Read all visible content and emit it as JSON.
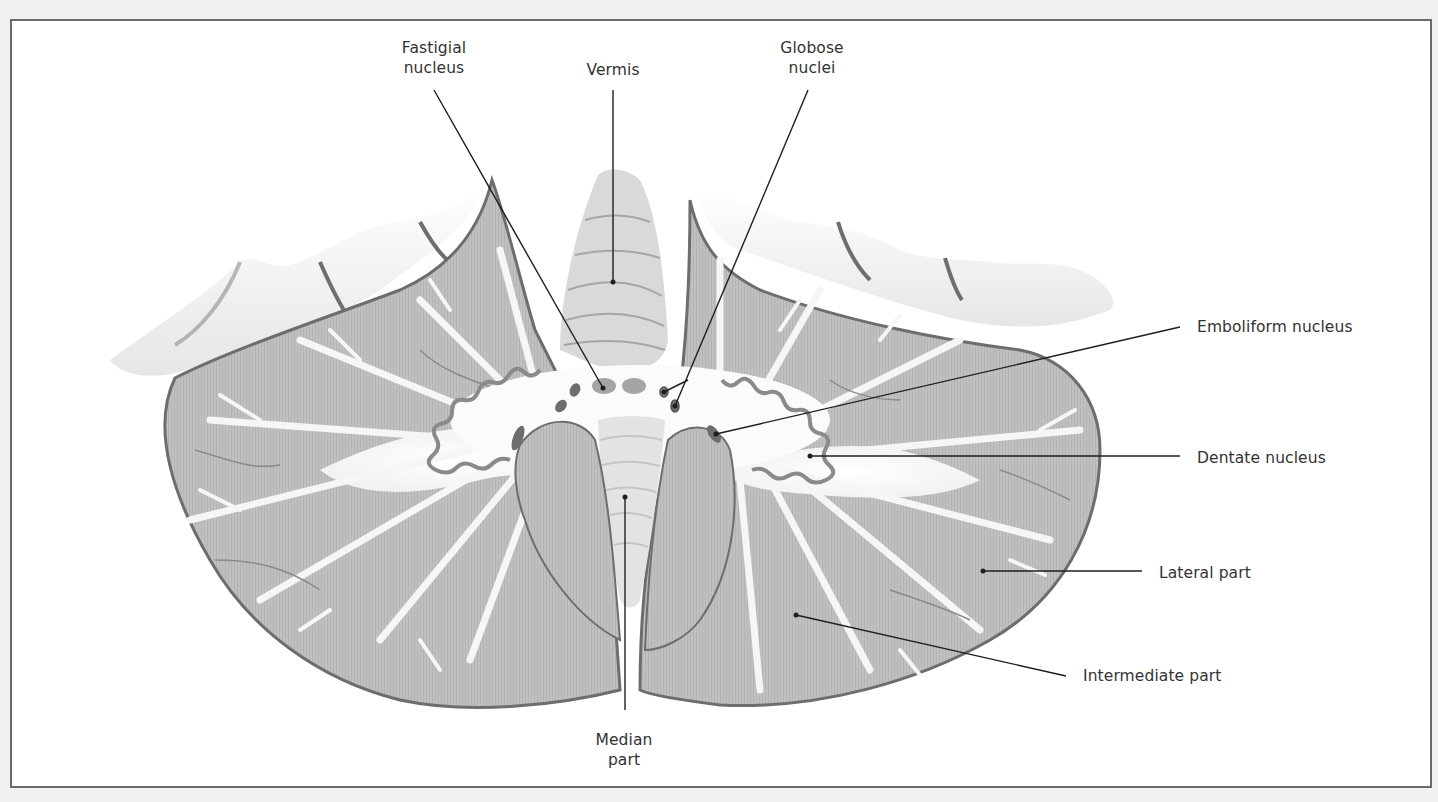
{
  "figure": {
    "colors": {
      "background": "#f1f1f1",
      "frame_fill": "#ffffff",
      "frame_border": "#6a6a6a",
      "gray_matter": "#bdbdbd",
      "gray_matter_dark": "#9a9a9a",
      "white_matter": "#f7f7f7",
      "cortex_shadow": "#5e5e5e",
      "cerebrum_fill": "#f4f4f4",
      "nucleus_fill": "#8c8c8c",
      "nucleus_dark": "#606060",
      "leader_line": "#1e1e1e",
      "label_text": "#333333"
    }
  },
  "labels": {
    "fastigial": {
      "line1": "Fastigial",
      "line2": "nucleus"
    },
    "vermis": {
      "line1": "Vermis"
    },
    "globose": {
      "line1": "Globose",
      "line2": "nuclei"
    },
    "emboliform": {
      "line1": "Emboliform nucleus"
    },
    "dentate": {
      "line1": "Dentate nucleus"
    },
    "lateral": {
      "line1": "Lateral part"
    },
    "intermediate": {
      "line1": "Intermediate part"
    },
    "median": {
      "line1": "Median",
      "line2": "part"
    }
  }
}
